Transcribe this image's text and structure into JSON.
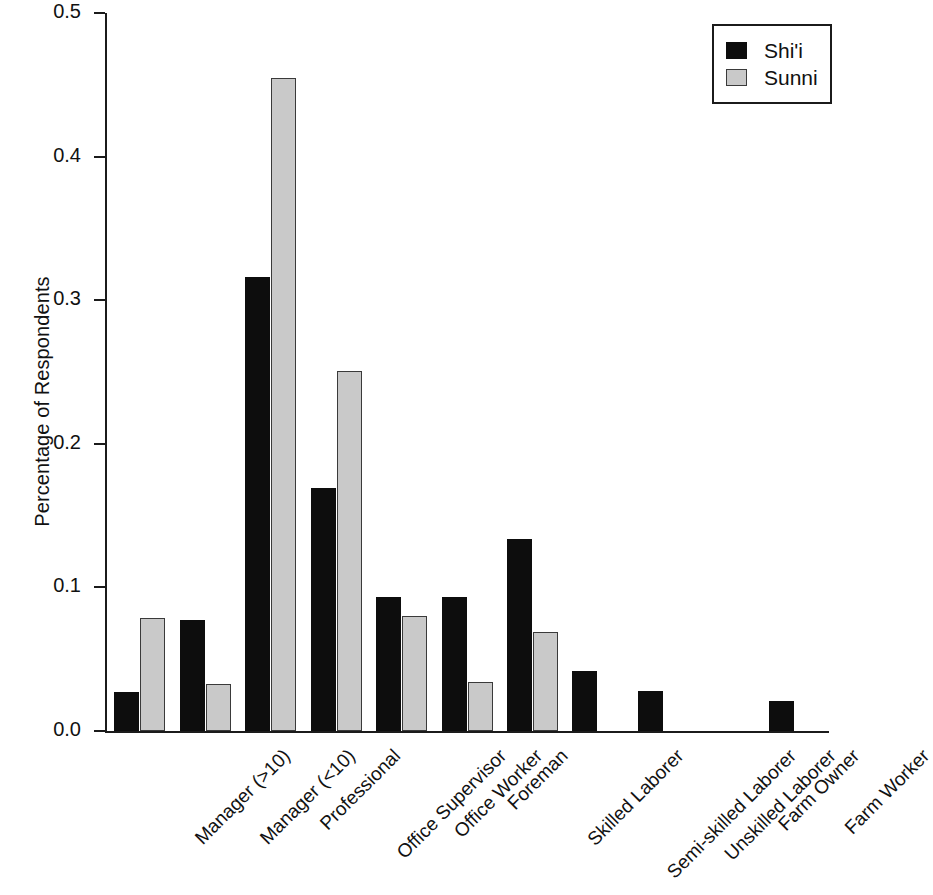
{
  "chart_data": {
    "type": "bar",
    "title": "",
    "xlabel": "",
    "ylabel": "Percentage of Respondents",
    "ylim": [
      0.0,
      0.5
    ],
    "yticks": [
      "0.0",
      "0.1",
      "0.2",
      "0.3",
      "0.4",
      "0.5"
    ],
    "ytick_values": [
      0.0,
      0.1,
      0.2,
      0.3,
      0.4,
      0.5
    ],
    "grid": false,
    "legend_position": "top-right",
    "categories": [
      "Manager (>10)",
      "Manager (<10)",
      "Professional",
      "Office Supervisor",
      "Office Worker",
      "Foreman",
      "Skilled Laborer",
      "Semi-skilled Laborer",
      "Unskilled Laborer",
      "Farm Owner",
      "Farm Worker"
    ],
    "series": [
      {
        "name": "Shi'i",
        "color": "#0d0d0d",
        "values": [
          0.027,
          0.077,
          0.316,
          0.169,
          0.093,
          0.093,
          0.134,
          0.042,
          0.028,
          0.0,
          0.021
        ]
      },
      {
        "name": "Sunni",
        "color": "#c9c9c9",
        "values": [
          0.079,
          0.033,
          0.455,
          0.251,
          0.08,
          0.034,
          0.069,
          0.0,
          0.0,
          0.0,
          0.0
        ]
      }
    ]
  },
  "legend": {
    "entries": [
      {
        "label": "Shi'i",
        "swatch": "shii"
      },
      {
        "label": "Sunni",
        "swatch": "sunni"
      }
    ]
  }
}
